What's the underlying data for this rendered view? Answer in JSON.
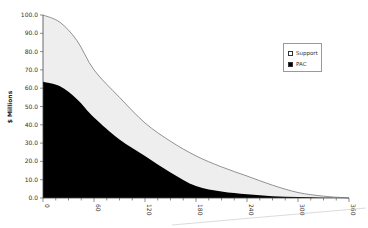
{
  "chart_data": {
    "type": "area",
    "title": "",
    "xlabel": "",
    "ylabel": "$ Millions",
    "xlim": [
      0,
      360
    ],
    "ylim": [
      0,
      100
    ],
    "x_ticks": [
      "0",
      "60",
      "120",
      "180",
      "240",
      "300",
      "360"
    ],
    "y_ticks": [
      "0.0",
      "10.0",
      "20.0",
      "30.0",
      "40.0",
      "50.0",
      "60.0",
      "70.0",
      "80.0",
      "90.0",
      "100.0"
    ],
    "grid": false,
    "legend_position": "right",
    "x": [
      0,
      20,
      40,
      60,
      90,
      120,
      150,
      180,
      210,
      240,
      270,
      300,
      330,
      360
    ],
    "series": [
      {
        "name": "Support",
        "color": "#eeeeee",
        "values": [
          100.0,
          96.0,
          86.0,
          70.0,
          55.0,
          41.0,
          31.0,
          23.0,
          17.0,
          12.0,
          7.0,
          3.0,
          1.0,
          0.0
        ]
      },
      {
        "name": "PAC",
        "color": "#000000",
        "values": [
          63.5,
          61.0,
          54.0,
          44.0,
          32.0,
          23.0,
          14.0,
          6.5,
          3.5,
          2.0,
          1.0,
          0.5,
          0.2,
          0.0
        ]
      }
    ]
  },
  "legend": {
    "items": [
      {
        "label": "Support",
        "swatch": "#ffffff"
      },
      {
        "label": "PAC",
        "swatch": "#000000"
      }
    ]
  }
}
